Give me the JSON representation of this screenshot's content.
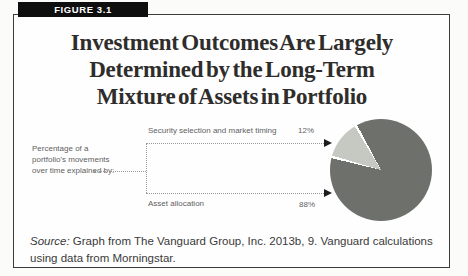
{
  "figure": {
    "label": "FIGURE 3.1"
  },
  "title": {
    "line1": "Investment Outcomes Are Largely",
    "line2": "Determined by the Long-Term",
    "line3": "Mixture of Assets in Portfolio"
  },
  "diagram": {
    "left_label_line1": "Percentage of a",
    "left_label_line2": "portfolio's movements",
    "left_label_line3": "over time explained by:",
    "slices": [
      {
        "label": "Security selection and market timing",
        "pct": "12%"
      },
      {
        "label": "Asset allocation",
        "pct": "88%"
      }
    ]
  },
  "source": {
    "prefix": "Source:",
    "text": " Graph from The Vanguard Group, Inc. 2013b, 9. Vanguard calculations using data from Morningstar."
  },
  "colors": {
    "pie_dark": "#6e706c",
    "pie_light": "#c6c8c2",
    "bar_bg": "#0e0e0e",
    "line_gray": "#9b9b9b",
    "label_gray": "#5e5e5e",
    "ink": "#2e2d2b"
  },
  "chart_data": {
    "type": "pie",
    "categories": [
      "Security selection and market timing",
      "Asset allocation"
    ],
    "values": [
      12,
      88
    ],
    "unit": "%",
    "title": "Investment Outcomes Are Largely Determined by the Long-Term Mixture of Assets in Portfolio",
    "annotation": "Percentage of a portfolio's movements over time explained by:",
    "legend_position": "callout-labels-left",
    "slice_colors": [
      "#c6c8c2",
      "#6e706c"
    ],
    "start_angle_deg_clockwise_from_top": {
      "light_slice_start": 286.5,
      "light_slice_end": 329
    }
  }
}
